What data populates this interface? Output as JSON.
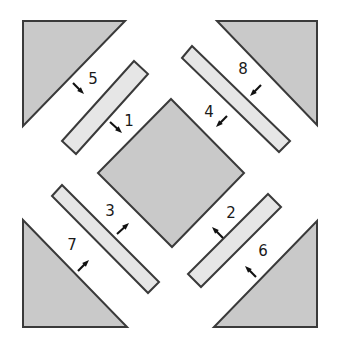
{
  "figure": {
    "canvas": {
      "width": 339,
      "height": 351,
      "background": "#ffffff"
    },
    "colors": {
      "triangle_fill": "#c9c9c9",
      "diamond_fill": "#c9c9c9",
      "bar_fill": "#e6e6e6",
      "stroke": "#3a3a3a",
      "label": "#1a1a1a",
      "arrow": "#111111"
    },
    "shapes": {
      "triangles": [
        {
          "name": "triangle-top-left",
          "points": "23,21 125,21 23,126",
          "fill": "#c9c9c9"
        },
        {
          "name": "triangle-top-right",
          "points": "217,21 317,21 317,125",
          "fill": "#c9c9c9"
        },
        {
          "name": "triangle-bottom-left",
          "points": "23,220 23,327 127,327",
          "fill": "#c9c9c9"
        },
        {
          "name": "triangle-bottom-right",
          "points": "317,221 317,327 214,327",
          "fill": "#c9c9c9"
        }
      ],
      "center_diamond": {
        "name": "center-square-diamond",
        "points": "171,99 244,173 172,247 98,173",
        "fill": "#c9c9c9"
      },
      "bars": [
        {
          "name": "bar-upper-left",
          "points": "134,61 148,74 76,154 62,141",
          "fill": "#e6e6e6"
        },
        {
          "name": "bar-upper-right",
          "points": "182,58 192,46 290,141 279,152",
          "fill": "#e6e6e6"
        },
        {
          "name": "bar-lower-left",
          "points": "52,196 62,185 159,282 148,293",
          "fill": "#e6e6e6"
        },
        {
          "name": "bar-lower-right",
          "points": "268,194 281,207 201,287 188,274",
          "fill": "#e6e6e6"
        }
      ]
    },
    "labels": [
      {
        "id": "1",
        "text": "1",
        "x": 129,
        "y": 126,
        "name": "label-1"
      },
      {
        "id": "2",
        "text": "2",
        "x": 231,
        "y": 218,
        "name": "label-2"
      },
      {
        "id": "3",
        "text": "3",
        "x": 110,
        "y": 216,
        "name": "label-3"
      },
      {
        "id": "4",
        "text": "4",
        "x": 209,
        "y": 117,
        "name": "label-4"
      },
      {
        "id": "5",
        "text": "5",
        "x": 93,
        "y": 84,
        "name": "label-5"
      },
      {
        "id": "6",
        "text": "6",
        "x": 263,
        "y": 256,
        "name": "label-6"
      },
      {
        "id": "7",
        "text": "7",
        "x": 72,
        "y": 250,
        "name": "label-7"
      },
      {
        "id": "8",
        "text": "8",
        "x": 243,
        "y": 74,
        "name": "label-8"
      }
    ],
    "arrows": [
      {
        "id": "arrow-1",
        "for_label": "1",
        "x1": 110,
        "y1": 122,
        "x2": 122,
        "y2": 133,
        "direction": "down-right"
      },
      {
        "id": "arrow-2",
        "for_label": "2",
        "x1": 223,
        "y1": 238,
        "x2": 212,
        "y2": 227,
        "direction": "up-left"
      },
      {
        "id": "arrow-3",
        "for_label": "3",
        "x1": 117,
        "y1": 234,
        "x2": 129,
        "y2": 223,
        "direction": "up-right"
      },
      {
        "id": "arrow-4",
        "for_label": "4",
        "x1": 227,
        "y1": 116,
        "x2": 216,
        "y2": 127,
        "direction": "down-left"
      },
      {
        "id": "arrow-5",
        "for_label": "5",
        "x1": 73,
        "y1": 83,
        "x2": 84,
        "y2": 94,
        "direction": "down-right"
      },
      {
        "id": "arrow-6",
        "for_label": "6",
        "x1": 256,
        "y1": 277,
        "x2": 245,
        "y2": 266,
        "direction": "up-left"
      },
      {
        "id": "arrow-7",
        "for_label": "7",
        "x1": 78,
        "y1": 271,
        "x2": 89,
        "y2": 260,
        "direction": "up-right"
      },
      {
        "id": "arrow-8",
        "for_label": "8",
        "x1": 261,
        "y1": 85,
        "x2": 250,
        "y2": 96,
        "direction": "down-left"
      }
    ]
  }
}
